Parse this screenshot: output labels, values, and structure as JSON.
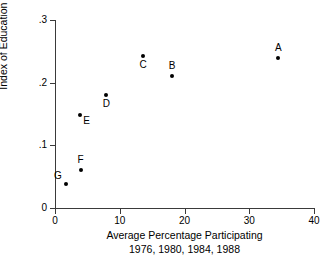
{
  "chart_data": {
    "type": "scatter",
    "title": "",
    "xlabel": "Average Percentage Participating",
    "xlabel_line2": "1976, 1980, 1984, 1988",
    "ylabel": "Index of Education Equality",
    "xlim": [
      0,
      40
    ],
    "ylim": [
      0,
      0.3
    ],
    "xticks": [
      0,
      10,
      20,
      30,
      40
    ],
    "xtick_labels": [
      "0",
      "10",
      "20",
      "30",
      "40"
    ],
    "yticks": [
      0,
      0.1,
      0.2,
      0.3
    ],
    "ytick_labels": [
      "0",
      ".1",
      ".2",
      ".3"
    ],
    "grid": false,
    "legend": "none",
    "marker_color": "#000000",
    "axis_color": "#3a3a3a",
    "points": [
      {
        "label": "A",
        "x": 34.5,
        "y": 0.24,
        "label_pos": "above"
      },
      {
        "label": "B",
        "x": 18.1,
        "y": 0.21,
        "label_pos": "above"
      },
      {
        "label": "C",
        "x": 13.6,
        "y": 0.242,
        "label_pos": "below"
      },
      {
        "label": "D",
        "x": 7.9,
        "y": 0.18,
        "label_pos": "below"
      },
      {
        "label": "E",
        "x": 3.9,
        "y": 0.148,
        "label_pos": "lower-right"
      },
      {
        "label": "F",
        "x": 4.0,
        "y": 0.06,
        "label_pos": "above"
      },
      {
        "label": "G",
        "x": 1.7,
        "y": 0.038,
        "label_pos": "upper-left"
      }
    ]
  }
}
